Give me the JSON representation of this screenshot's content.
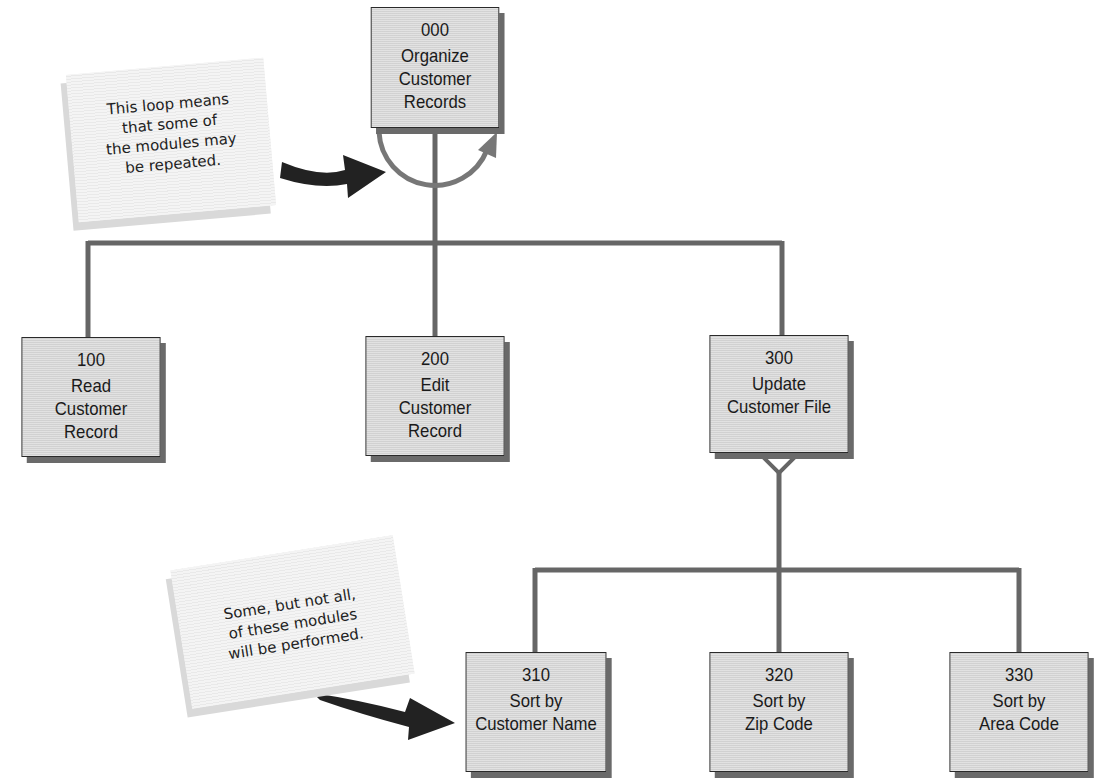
{
  "diagram": {
    "type": "structure-chart",
    "root": {
      "id": "000",
      "label": "Organize\nCustomer\nRecords"
    },
    "level1": [
      {
        "id": "100",
        "label": "Read\nCustomer\nRecord"
      },
      {
        "id": "200",
        "label": "Edit\nCustomer\nRecord"
      },
      {
        "id": "300",
        "label": "Update\nCustomer File"
      }
    ],
    "level2": [
      {
        "id": "310",
        "label": "Sort by\nCustomer Name"
      },
      {
        "id": "320",
        "label": "Sort by\nZip Code"
      },
      {
        "id": "330",
        "label": "Sort by\nArea Code"
      }
    ],
    "loop_symbol": "loop-arc-icon",
    "condition_symbol": "diamond-icon",
    "notes": [
      {
        "text": "This loop means\nthat some of\nthe modules may\nbe repeated.",
        "points_to": "loop-arc-icon"
      },
      {
        "text": "Some, but not all,\nof these modules\nwill be performed.",
        "points_to": "310"
      }
    ],
    "colors": {
      "box_fill": "#d8d8d8",
      "box_border": "#2a2a2a",
      "box_shadow": "#6a6a6a",
      "connector": "#666666",
      "arrow": "#222222",
      "note_fill": "#f1f1f1"
    }
  }
}
